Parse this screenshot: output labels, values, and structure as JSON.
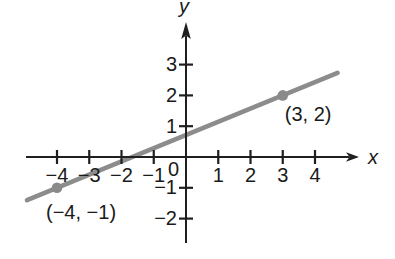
{
  "colors": {
    "background": "#ffffff",
    "axis": "#1f1f1f",
    "text": "#1a1a1a",
    "line": "#8c8c8c",
    "point": "#8a8a8a"
  },
  "chart_data": {
    "type": "line",
    "title": "",
    "xlabel": "x",
    "ylabel": "y",
    "origin_label": "0",
    "grid": false,
    "xlim": [
      -5,
      5.4
    ],
    "ylim": [
      -2.8,
      4.4
    ],
    "x_ticks": [
      {
        "value": -4,
        "label": "−4"
      },
      {
        "value": -3,
        "label": "−3"
      },
      {
        "value": -2,
        "label": "−2"
      },
      {
        "value": -1,
        "label": "−1"
      },
      {
        "value": 1,
        "label": "1"
      },
      {
        "value": 2,
        "label": "2"
      },
      {
        "value": 3,
        "label": "3"
      },
      {
        "value": 4,
        "label": "4"
      }
    ],
    "y_ticks": [
      {
        "value": -2,
        "label": "−2"
      },
      {
        "value": -1,
        "label": "−1"
      },
      {
        "value": 1,
        "label": "1"
      },
      {
        "value": 2,
        "label": "2"
      },
      {
        "value": 3,
        "label": "3"
      }
    ],
    "series": [
      {
        "name": "line through (−4, −1) and (3, 2)",
        "points_xy": [
          [
            -4,
            -1
          ],
          [
            3,
            2
          ]
        ],
        "draw_from_x": -4.93,
        "draw_to_x": 4.7,
        "color": "#8c8c8c",
        "width": 4.6
      }
    ],
    "marked_points": [
      {
        "x": -4,
        "y": -1,
        "label": "(−4, −1)",
        "label_placement": "below-left"
      },
      {
        "x": 3,
        "y": 2,
        "label": "(3, 2)",
        "label_placement": "below-right"
      }
    ]
  }
}
